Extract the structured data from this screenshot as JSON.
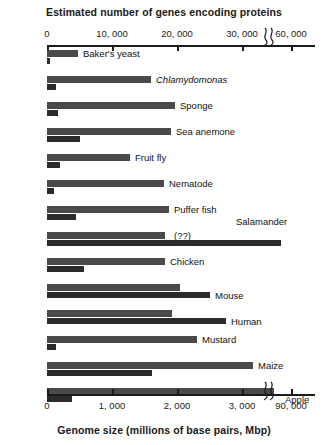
{
  "chart_data": {
    "type": "bar",
    "orientation": "horizontal",
    "title": "",
    "top_axis": {
      "label": "Estimated number of genes encoding proteins",
      "ticks": [
        "0",
        "10, 000",
        "20, 000",
        "30, 000",
        "60, 000"
      ],
      "tick_values": [
        0,
        10000,
        20000,
        30000,
        60000
      ],
      "has_break": true,
      "break_after": "30, 000"
    },
    "bottom_axis": {
      "label": "Genome size (millions of base pairs, Mbp)",
      "ticks": [
        "0",
        "1, 000",
        "2, 000",
        "3, 000",
        "90, 000"
      ],
      "tick_values": [
        0,
        1000,
        2000,
        3000,
        90000
      ],
      "has_break": true,
      "break_after": "3, 000"
    },
    "series": [
      {
        "name": "Estimated number of genes encoding proteins",
        "color": "#4a4a4a"
      },
      {
        "name": "Genome size (millions of base pairs, Mbp)",
        "color": "#2b2b2b"
      }
    ],
    "categories": [
      "Baker's yeast",
      "Chlamydomonas",
      "Sponge",
      "Sea anemone",
      "Fruit fly",
      "Nematode",
      "Puffer fish",
      "Salamander",
      "Chicken",
      "Mouse",
      "Human",
      "Mustard",
      "Maize",
      "Apple"
    ],
    "genes": [
      6000,
      15000,
      18000,
      18000,
      14000,
      20000,
      21000,
      null,
      17000,
      23000,
      21000,
      27000,
      32000,
      57000
    ],
    "genome_size_mbp": [
      12,
      120,
      170,
      450,
      180,
      100,
      400,
      90000,
      1200,
      2700,
      3200,
      125,
      2400,
      750
    ],
    "grid": false,
    "legend": "none"
  },
  "top_axis_title": "Estimated number of genes encoding proteins",
  "bottom_axis_title": "Genome size (millions of base pairs, Mbp)",
  "top_ticks": [
    {
      "text": "0",
      "x": 47
    },
    {
      "text": "10, 000",
      "x": 112
    },
    {
      "text": "20, 000",
      "x": 177
    },
    {
      "text": "30, 000",
      "x": 242
    },
    {
      "text": "60, 000",
      "x": 291
    }
  ],
  "bottom_ticks": [
    {
      "text": "0",
      "x": 47
    },
    {
      "text": "1, 000",
      "x": 112
    },
    {
      "text": "2, 000",
      "x": 177
    },
    {
      "text": "3, 000",
      "x": 242
    },
    {
      "text": "90, 000",
      "x": 291
    }
  ],
  "break_glyph": "~",
  "rows": [
    {
      "label": "Baker's yeast",
      "italic": false,
      "genes_w": 31,
      "genome_w": 3,
      "label_x": 83,
      "label_y": -2,
      "top": 4
    },
    {
      "label": "Chlamydomonas",
      "italic": true,
      "genes_w": 104,
      "genome_w": 9,
      "label_x": 156,
      "label_y": -2,
      "top": 30
    },
    {
      "label": "Sponge",
      "italic": false,
      "genes_w": 128,
      "genome_w": 11,
      "label_x": 180,
      "label_y": -2,
      "top": 56
    },
    {
      "label": "Sea anemone",
      "italic": false,
      "genes_w": 124,
      "genome_w": 33,
      "label_x": 176,
      "label_y": -2,
      "top": 82
    },
    {
      "label": "Fruit fly",
      "italic": false,
      "genes_w": 83,
      "genome_w": 13,
      "label_x": 135,
      "label_y": -2,
      "top": 108
    },
    {
      "label": "Nematode",
      "italic": false,
      "genes_w": 117,
      "genome_w": 7,
      "label_x": 169,
      "label_y": -2,
      "top": 134
    },
    {
      "label": "Puffer fish",
      "italic": false,
      "genes_w": 122,
      "genome_w": 29,
      "label_x": 174,
      "label_y": -2,
      "top": 160
    },
    {
      "label": "(??)",
      "italic": false,
      "genes_w": 118,
      "genome_w": 234,
      "label_x": 174,
      "label_y": -2,
      "top": 186
    },
    {
      "label": "Chicken",
      "italic": false,
      "genes_w": 118,
      "genome_w": 37,
      "label_x": 170,
      "label_y": -2,
      "top": 212
    },
    {
      "label": "Mouse",
      "italic": false,
      "genes_w": 133,
      "genome_w": 163,
      "label_x": 215,
      "label_y": 6,
      "top": 238
    },
    {
      "label": "Human",
      "italic": false,
      "genes_w": 125,
      "genome_w": 179,
      "label_x": 231,
      "label_y": 6,
      "top": 264
    },
    {
      "label": "Mustard",
      "italic": false,
      "genes_w": 150,
      "genome_w": 9,
      "label_x": 202,
      "label_y": -2,
      "top": 290
    },
    {
      "label": "Maize",
      "italic": false,
      "genes_w": 206,
      "genome_w": 105,
      "label_x": 258,
      "label_y": -2,
      "top": 316
    },
    {
      "label": "Apple",
      "italic": false,
      "genes_w": 227,
      "genome_w": 25,
      "label_x": 285,
      "label_y": 6,
      "top": 342
    }
  ],
  "salamander_label": "Salamander",
  "salamander_label_x": 236,
  "salamander_label_y": 216
}
